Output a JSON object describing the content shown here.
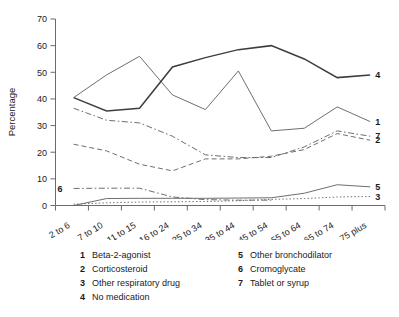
{
  "chart_data": {
    "type": "line",
    "title": "",
    "xlabel": "",
    "ylabel": "Percentage",
    "ylim": [
      0,
      70
    ],
    "yticks": [
      0,
      10,
      20,
      30,
      40,
      50,
      60,
      70
    ],
    "grid": false,
    "legend_position": "below-plot",
    "categories": [
      "2 to 6",
      "7 to 10",
      "11 to 15",
      "16 to 24",
      "25 to 34",
      "35 to 44",
      "45 to 54",
      "55 to 64",
      "65 to 74",
      "75 plus"
    ],
    "series": [
      {
        "name": "Beta-2-agonist",
        "number": "1",
        "style": "solid-thin",
        "end_label": "1",
        "values": [
          40.5,
          49.0,
          56.0,
          41.5,
          36.0,
          50.5,
          28.0,
          29.0,
          37.0,
          31.5
        ]
      },
      {
        "name": "Corticosteroid",
        "number": "2",
        "style": "dashed",
        "end_label": "2",
        "values": [
          23.0,
          20.5,
          15.5,
          13.0,
          17.5,
          17.5,
          18.5,
          21.0,
          27.0,
          24.5
        ]
      },
      {
        "name": "Other respiratory drug",
        "number": "3",
        "style": "dotted",
        "end_label": "3",
        "values": [
          0.5,
          1.0,
          1.3,
          1.4,
          1.5,
          1.8,
          2.3,
          2.6,
          3.2,
          3.4
        ]
      },
      {
        "name": "No medication",
        "number": "4",
        "style": "solid-thick",
        "end_label": "4",
        "values": [
          40.5,
          35.5,
          36.5,
          52.0,
          55.5,
          58.5,
          60.0,
          55.0,
          48.0,
          49.0
        ]
      },
      {
        "name": "Other bronchodilator",
        "number": "5",
        "style": "solid-thin",
        "end_label": "5",
        "values": [
          0.0,
          2.6,
          2.7,
          2.7,
          2.7,
          2.8,
          2.9,
          4.6,
          7.8,
          7.0
        ]
      },
      {
        "name": "Cromoglycate",
        "number": "6",
        "style": "dash-dot",
        "inner_label": "6",
        "values": [
          6.4,
          6.5,
          6.5,
          3.2,
          2.2,
          2.0,
          2.0,
          null,
          null,
          null
        ]
      },
      {
        "name": "Tablet or syrup",
        "number": "7",
        "style": "dash-dot",
        "end_label": "7",
        "values": [
          36.5,
          32.0,
          31.0,
          26.0,
          19.0,
          18.0,
          18.0,
          22.0,
          28.0,
          26.0
        ]
      }
    ]
  },
  "axis": {
    "ylabel": "Percentage",
    "ytick_labels": [
      "0",
      "10",
      "20",
      "30",
      "40",
      "50",
      "60",
      "70"
    ],
    "xtick_labels": [
      "2 to 6",
      "7 to 10",
      "11 to 15",
      "16 to 24",
      "25 to 34",
      "35 to 44",
      "45 to 54",
      "55 to 64",
      "65 to 74",
      "75 plus"
    ]
  },
  "series_tags": {
    "tag4": "4",
    "tag1": "1",
    "tag7": "7",
    "tag2": "2",
    "tag5": "5",
    "tag3": "3",
    "tag6": "6"
  },
  "legend": {
    "left": [
      {
        "number": "1",
        "label": "Beta-2-agonist"
      },
      {
        "number": "2",
        "label": "Corticosteroid"
      },
      {
        "number": "3",
        "label": "Other respiratory drug"
      },
      {
        "number": "4",
        "label": "No medication"
      }
    ],
    "right": [
      {
        "number": "5",
        "label": "Other bronchodilator"
      },
      {
        "number": "6",
        "label": "Cromoglycate"
      },
      {
        "number": "7",
        "label": "Tablet or syrup"
      }
    ]
  },
  "colors": {
    "line_dark": "#3d3d3d",
    "line_mid": "#6e6e6e",
    "axis": "#6b6b6b",
    "text": "#1a1a1a",
    "background": "#ffffff"
  }
}
